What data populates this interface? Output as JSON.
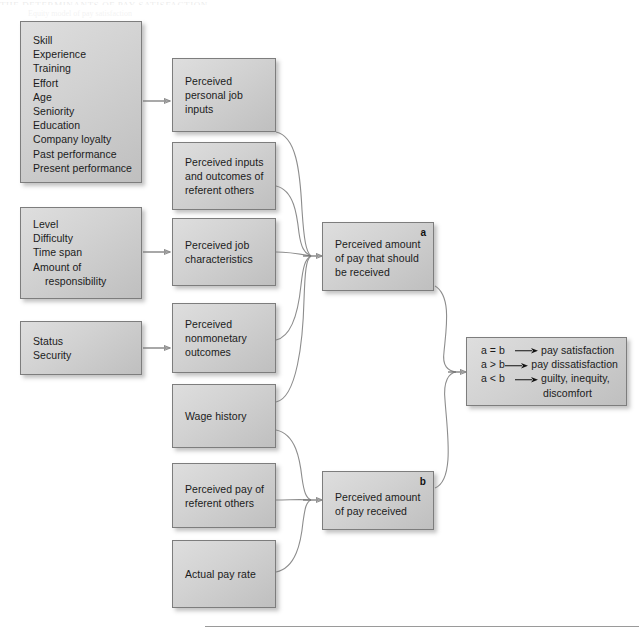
{
  "page": {
    "running_head": "THE DETERMINANTS OF PAY SATISFACTION",
    "subhead": "Equity model of pay satisfaction"
  },
  "boxes": {
    "personal_inputs": {
      "lines": [
        "Skill",
        "Experience",
        "Training",
        "Effort",
        "Age",
        "Seniority",
        "Education",
        "Company loyalty",
        "Past performance",
        "Present performance"
      ]
    },
    "job_attributes": {
      "lines": [
        "Level",
        "Difficulty",
        "Time span",
        "Amount of",
        "responsibility"
      ]
    },
    "nonmonetary": {
      "lines": [
        "Status",
        "Security"
      ]
    },
    "perceived_personal_job_inputs": {
      "lines": [
        "Perceived",
        "personal job",
        "inputs"
      ]
    },
    "perceived_referent": {
      "lines": [
        "Perceived inputs",
        "and outcomes of",
        "referent others"
      ]
    },
    "perceived_job_characteristics": {
      "lines": [
        "Perceived job",
        "characteristics"
      ]
    },
    "perceived_nonmonetary_outcomes": {
      "lines": [
        "Perceived",
        "nonmonetary",
        "outcomes"
      ]
    },
    "wage_history": {
      "lines": [
        "Wage history"
      ]
    },
    "perceived_pay_referent": {
      "lines": [
        "Perceived pay of",
        "referent others"
      ]
    },
    "actual_pay_rate": {
      "lines": [
        "Actual pay rate"
      ]
    },
    "pay_should_be_received": {
      "tag": "a",
      "lines": [
        "Perceived amount",
        "of pay that should",
        "be received"
      ]
    },
    "pay_received": {
      "tag": "b",
      "lines": [
        "Perceived amount",
        "of pay received"
      ]
    }
  },
  "outcome_panel": {
    "rows": [
      {
        "expr": "a = b",
        "result": "pay satisfaction"
      },
      {
        "expr": "a > b",
        "result": "pay dissatisfaction"
      },
      {
        "expr": "a < b",
        "result": "guilty, inequity,"
      }
    ],
    "continuation": "discomfort"
  },
  "colors": {
    "box_fill_light": "#dedede",
    "box_fill_dark": "#bfbfbf",
    "box_border": "#7d7d7d",
    "connector": "#8d8d8d",
    "text": "#1b1b1b",
    "page_background": "#ffffff",
    "rule": "#9a9a9a"
  }
}
